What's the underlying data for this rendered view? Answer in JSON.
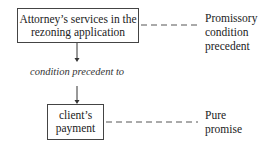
{
  "diagram": {
    "top_box": {
      "lines": [
        "Attorney’s services in the",
        "rezoning application"
      ]
    },
    "connector_label": "condition precedent to",
    "bottom_box": {
      "lines": [
        "client’s",
        "payment"
      ]
    },
    "top_annotation": {
      "lines": [
        "Promissory",
        "condition",
        "precedent"
      ]
    },
    "bottom_annotation": {
      "lines": [
        "Pure",
        "promise"
      ]
    }
  }
}
